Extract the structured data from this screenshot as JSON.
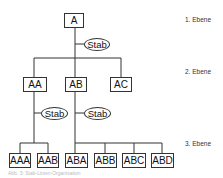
{
  "diagram": {
    "type": "organizational-hierarchy",
    "nodes": {
      "root": "A",
      "level2": [
        "AA",
        "AB",
        "AC"
      ],
      "level3_under_AA": [
        "AAA",
        "AAB"
      ],
      "level3_under_AB": [
        "ABA",
        "ABB",
        "ABC",
        "ABD"
      ]
    },
    "staff_label": "Stab",
    "levels": [
      "1. Ebene",
      "2. Ebene",
      "3. Ebene"
    ],
    "caption": "Abb. 3: Stab-Linien-Organisation"
  }
}
